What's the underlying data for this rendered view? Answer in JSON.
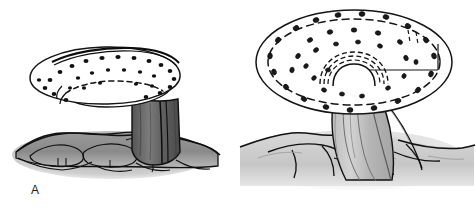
{
  "figure": {
    "type": "line-drawing",
    "background_color": "#ffffff",
    "panel_count": 2
  },
  "panels": [
    {
      "id": "A",
      "label": "A",
      "label_color": "#1b1b1b",
      "cap": {
        "name": "cap-ellipse",
        "view": "oblique-from-below",
        "outline_color": "#141414",
        "fill_color": "#ffffff",
        "dot_count": 26,
        "dot_color": "#111111",
        "dashed_inner_margin": true
      },
      "stalk": {
        "name": "stalk",
        "shade": "dark-gray",
        "fill_color": "#6d6d6d",
        "outline_color": "#111111",
        "has_vertical_stripe": true
      },
      "ground": {
        "name": "ground",
        "fill_color": "#8e8e8e",
        "outline_color": "#111111",
        "style": "lumpy-root-mass"
      }
    },
    {
      "id": "B",
      "label": "B",
      "label_color": "#1b1b1b",
      "cap": {
        "name": "cap-ellipse",
        "view": "from-above-oblique",
        "outline_color": "#141414",
        "fill_color": "#ffffff",
        "dot_count": 38,
        "dot_color": "#1a1a1a",
        "dot_shape": "small-oval",
        "dashed_inner_margin": true,
        "central_dome_rings": 3,
        "has_radial_line": true
      },
      "stalk": {
        "name": "stalk",
        "shade": "light-gray",
        "fill_color": "#c3c3c3",
        "outline_color": "#111111",
        "has_peaked_collar": true
      },
      "ground": {
        "name": "ground",
        "fill_color": "#d2d2d2",
        "outline_color": "#111111",
        "style": "smooth-rolling-mounds"
      }
    }
  ],
  "colors": {
    "ink": "#141414",
    "background": "#ffffff",
    "dark_shade": "#6d6d6d",
    "mid_shade": "#8e8e8e",
    "light_shade": "#c9c9c9"
  }
}
